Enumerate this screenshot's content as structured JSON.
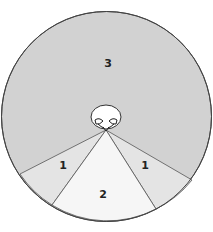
{
  "diagram": {
    "type": "visual-field-zones",
    "colors": {
      "zone3": "#d2d2d2",
      "zone1": "#e4e4e4",
      "zone2": "#f6f6f6",
      "outline": "#444444",
      "head": "#ffffff"
    },
    "zones": [
      {
        "id": "zone-3",
        "label": "3"
      },
      {
        "id": "zone-1-left",
        "label": "1"
      },
      {
        "id": "zone-2",
        "label": "2"
      },
      {
        "id": "zone-1-right",
        "label": "1"
      }
    ]
  }
}
